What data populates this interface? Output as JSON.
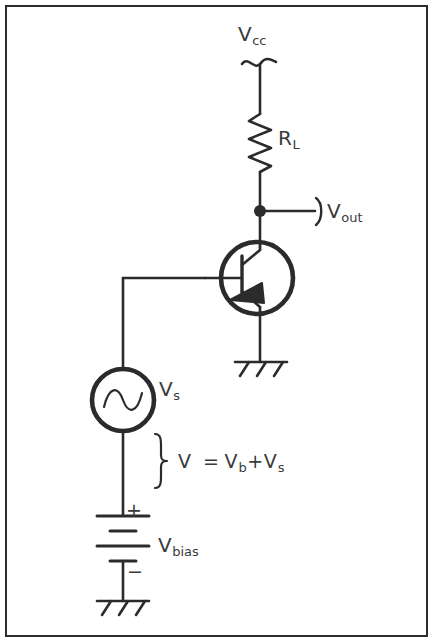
{
  "diagram": {
    "stroke_color": "#2b2b2b",
    "text_color": "#3a3a3a",
    "background_color": "#ffffff",
    "border_color": "#2b2b2b"
  },
  "labels": {
    "vcc": {
      "base": "V",
      "sub": "cc"
    },
    "rl": {
      "base": "R",
      "sub": "L"
    },
    "vout": {
      "base": "V",
      "sub": "out"
    },
    "vs": {
      "base": "V",
      "sub": "s"
    },
    "vbias": {
      "base": "V",
      "sub": "bias"
    },
    "equation": {
      "v": "V",
      "equals": "=",
      "vb_base": "V",
      "vb_sub": "b",
      "plus": "+",
      "vs_base": "V",
      "vs_sub": "s"
    },
    "battery_plus": "+",
    "battery_minus": "−"
  },
  "components": [
    {
      "name": "supply-terminal-vcc",
      "type": "terminal",
      "label": "V_cc"
    },
    {
      "name": "load-resistor",
      "type": "resistor",
      "label": "R_L"
    },
    {
      "name": "output-node",
      "type": "junction",
      "label": "V_out"
    },
    {
      "name": "npn-transistor",
      "type": "bjt-npn"
    },
    {
      "name": "emitter-ground",
      "type": "chassis-ground"
    },
    {
      "name": "ac-source",
      "type": "ac-voltage-source",
      "label": "V_s"
    },
    {
      "name": "bias-battery",
      "type": "battery",
      "label": "V_bias"
    },
    {
      "name": "battery-ground",
      "type": "chassis-ground"
    },
    {
      "name": "total-voltage-brace",
      "type": "brace",
      "label": "V = V_b+V_s"
    }
  ]
}
